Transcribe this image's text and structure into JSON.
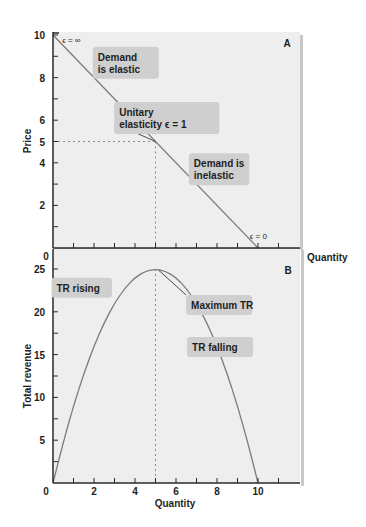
{
  "colors": {
    "panel_bg": "#eeeeee",
    "panel_shadow": "#c8c8c8",
    "curve": "#7a7a7a",
    "axis": "#2a2a2a",
    "label_box": "#cfcfcf",
    "dashed_guide": "#8a8a8a"
  },
  "chart_data": [
    {
      "id": "A",
      "type": "line",
      "panel_label": "A",
      "title": "",
      "xlabel": "Quantity",
      "ylabel": "Price",
      "xlim": [
        0,
        11.5
      ],
      "ylim": [
        0,
        10
      ],
      "x_ticks": [
        1,
        2,
        3,
        4,
        5,
        6,
        7,
        8,
        9,
        10,
        11
      ],
      "x_tick_labels": [
        "0",
        "2",
        "4",
        "6",
        "8",
        "10"
      ],
      "x_tick_label_values": [
        0,
        2,
        4,
        6,
        8,
        10
      ],
      "y_ticks": [
        1,
        2,
        3,
        4,
        5,
        6,
        7,
        8,
        9,
        10
      ],
      "y_tick_labels": [
        "2",
        "4",
        "5",
        "6",
        "8",
        "10"
      ],
      "y_tick_label_values": [
        2,
        4,
        5,
        6,
        8,
        10
      ],
      "grid": false,
      "series": [
        {
          "name": "Demand",
          "x": [
            0,
            10
          ],
          "y": [
            10,
            0
          ]
        }
      ],
      "guides": [
        {
          "type": "dashed",
          "from": [
            0,
            5
          ],
          "to": [
            5,
            5
          ]
        },
        {
          "type": "dashed",
          "from": [
            5,
            5
          ],
          "to": [
            5,
            0
          ],
          "extends_into_panel": "B"
        }
      ],
      "annotations": [
        {
          "text": "ϵ = ∞",
          "at": [
            0.45,
            9.75
          ]
        },
        {
          "text": "ϵ = 0",
          "at": [
            9.6,
            0.55
          ]
        },
        {
          "lines": [
            "Demand",
            "is elastic"
          ],
          "box": true,
          "at": [
            3.55,
            8.7
          ]
        },
        {
          "lines": [
            "Unitary",
            "elasticity  ϵ = 1"
          ],
          "box": true,
          "leader_to": [
            5,
            5
          ],
          "at": [
            5.55,
            6.1
          ]
        },
        {
          "lines": [
            "Demand is",
            "inelastic"
          ],
          "box": true,
          "at": [
            8.1,
            3.7
          ]
        }
      ]
    },
    {
      "id": "B",
      "type": "line",
      "panel_label": "B",
      "title": "",
      "xlabel": "Quantity",
      "ylabel": "Total revenue",
      "xlim": [
        0,
        11.5
      ],
      "ylim": [
        0,
        25.9
      ],
      "x_ticks": [
        1,
        2,
        3,
        4,
        5,
        6,
        7,
        8,
        9,
        10,
        11
      ],
      "x_tick_labels": [
        "0",
        "2",
        "4",
        "6",
        "8",
        "10"
      ],
      "x_tick_label_values": [
        0,
        2,
        4,
        6,
        8,
        10
      ],
      "y_ticks": [
        2.5,
        5,
        7.5,
        10,
        12.5,
        15,
        17.5,
        20,
        22.5,
        25
      ],
      "y_tick_labels": [
        "5",
        "10",
        "15",
        "20",
        "25"
      ],
      "y_tick_label_values": [
        5,
        10,
        15,
        20,
        25
      ],
      "grid": false,
      "series": [
        {
          "name": "Total revenue (TR = P × Q)",
          "x": [
            0,
            0.5,
            1,
            1.5,
            2,
            2.5,
            3,
            3.5,
            4,
            4.5,
            5,
            5.5,
            6,
            6.5,
            7,
            7.5,
            8,
            8.5,
            9,
            9.5,
            10
          ],
          "y": [
            0,
            4.75,
            9,
            12.75,
            16,
            18.75,
            21,
            22.75,
            24,
            24.75,
            25,
            24.75,
            24,
            22.75,
            21,
            18.75,
            16,
            12.75,
            9,
            4.75,
            0
          ]
        }
      ],
      "guides": [
        {
          "type": "dashed",
          "from": [
            5,
            25
          ],
          "to": [
            5,
            0
          ]
        }
      ],
      "annotations": [
        {
          "lines": [
            "TR rising"
          ],
          "box": true,
          "at": [
            1.4,
            22.8
          ]
        },
        {
          "lines": [
            "Maximum TR"
          ],
          "box": true,
          "leader_to": [
            5,
            25
          ],
          "at": [
            8.1,
            20.8
          ]
        },
        {
          "lines": [
            "TR falling"
          ],
          "box": true,
          "at": [
            8.15,
            15.9
          ]
        }
      ]
    }
  ]
}
